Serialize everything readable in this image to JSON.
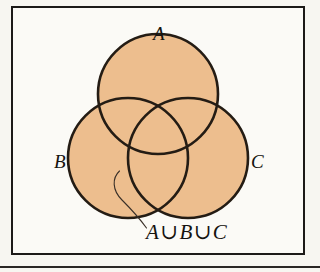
{
  "figure": {
    "kind": "venn-diagram",
    "frame_border_color": "#1c1a18",
    "page_background": "#f7f6f1",
    "panel_background": "#fbfaf6"
  },
  "diagram": {
    "fill_color": "#edbe8e",
    "stroke_color": "#241c14",
    "stroke_width": 2.6,
    "circles": [
      {
        "label": "A",
        "cx": 158,
        "cy": 94,
        "r": 60
      },
      {
        "label": "B",
        "cx": 128,
        "cy": 158,
        "r": 60
      },
      {
        "label": "C",
        "cx": 188,
        "cy": 158,
        "r": 60
      }
    ]
  },
  "labels": {
    "a": "A",
    "b": "B",
    "c": "C"
  },
  "annotation": {
    "text": "A∪B∪C",
    "leader_line_color": "#3a3028"
  }
}
